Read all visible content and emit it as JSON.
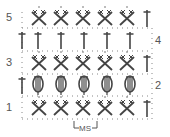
{
  "diagram": {
    "type": "crochet-stitch-chart",
    "rows": [
      {
        "number": "5",
        "label_side": "left",
        "stitches": [
          "sc-crossed",
          "sc-crossed",
          "sc-crossed",
          "sc-crossed",
          "sc-crossed",
          "dc"
        ]
      },
      {
        "number": "4",
        "label_side": "right",
        "stitches": [
          "dc",
          "dc",
          "dc",
          "dc",
          "dc",
          "dc"
        ]
      },
      {
        "number": "3",
        "label_side": "left",
        "stitches": [
          "sc-crossed",
          "sc-crossed",
          "sc-crossed",
          "sc-crossed",
          "sc-crossed",
          "dc"
        ]
      },
      {
        "number": "2",
        "label_side": "right",
        "stitches": [
          "dc",
          "puff",
          "puff",
          "puff",
          "puff",
          "puff"
        ]
      },
      {
        "number": "1",
        "label_side": "left",
        "stitches": [
          "sc-crossed",
          "sc-crossed",
          "sc-crossed",
          "sc-crossed",
          "sc-crossed",
          "dc"
        ]
      }
    ],
    "repeat_label": "MS",
    "colors": {
      "ink": "#444444",
      "label": "#555555",
      "dots": "#777777"
    }
  }
}
